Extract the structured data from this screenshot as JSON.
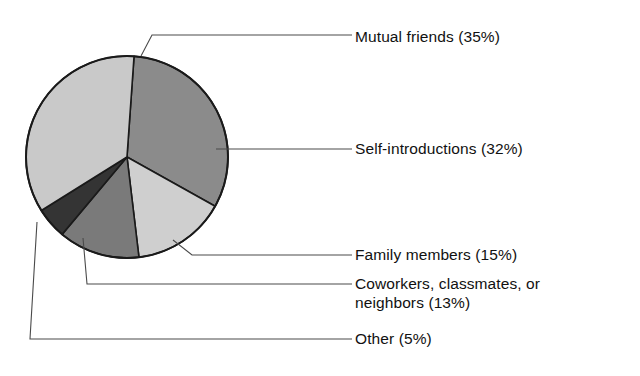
{
  "chart_data": {
    "type": "pie",
    "title": "",
    "subtitle": "",
    "xlabel": "",
    "ylabel": "",
    "legend_position": "right-callout-labels",
    "grid": false,
    "categories": [
      "Mutual friends",
      "Self-introductions",
      "Family members",
      "Coworkers, classmates, or neighbors",
      "Other"
    ],
    "values": [
      35,
      32,
      15,
      13,
      5
    ],
    "unit": "%",
    "slices": [
      {
        "label": "Mutual friends (35%)",
        "name": "Mutual friends",
        "value": 35,
        "color": "#c9c9c9",
        "start_angle": 355,
        "end_angle": 481
      },
      {
        "label": "Self-introductions (32%)",
        "name": "Self-introductions",
        "value": 32,
        "color": "#8b8b8b",
        "start_angle": 4,
        "end_angle": 119
      },
      {
        "label": "Family members (15%)",
        "name": "Family members",
        "value": 15,
        "color": "#cfcfcf",
        "start_angle": 119,
        "end_angle": 173
      },
      {
        "label": "Coworkers, classmates, or neighbors (13%)",
        "name": "Coworkers, classmates, or neighbors",
        "value": 13,
        "color": "#7a7a7a",
        "start_angle": 173,
        "end_angle": 220
      },
      {
        "label": "Other (5%)",
        "name": "Other",
        "value": 5,
        "color": "#343434",
        "start_angle": 220,
        "end_angle": 238
      }
    ],
    "labels": {
      "mutual_friends": "Mutual friends (35%)",
      "self_introductions": "Self-introductions (32%)",
      "family_members": "Family members (15%)",
      "coworkers_line1": "Coworkers, classmates, or",
      "coworkers_line2": "neighbors (13%)",
      "coworkers_full": "Coworkers, classmates, or neighbors (13%)",
      "other": "Other (5%)"
    },
    "colors": {
      "background": "#ffffff",
      "outline": "#1a1a1a",
      "text": "#111111",
      "leader_line": "#4a4a4a",
      "mutual_friends": "#c9c9c9",
      "self_introductions": "#8b8b8b",
      "family_members": "#cfcfcf",
      "coworkers": "#7a7a7a",
      "other": "#343434"
    },
    "geometry": {
      "center_x": 127,
      "center_y": 157,
      "radius": 101
    }
  }
}
